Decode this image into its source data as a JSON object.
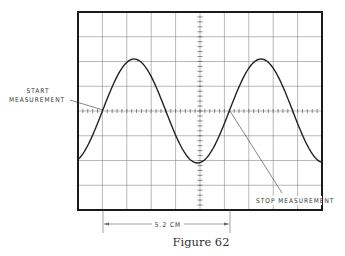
{
  "figure": {
    "caption": "Figure 62",
    "labels": {
      "start_line1": "START",
      "start_line2": "MEASUREMENT",
      "stop": "STOP MEASUREMENT",
      "dimension": "5.2 CM"
    },
    "graticule": {
      "columns": 10,
      "rows": 8,
      "minor_ticks_per_division": 5
    },
    "colors": {
      "frame": "#1a1a1a",
      "grid": "#8a8a8a",
      "trace": "#222222",
      "text": "#333333"
    }
  },
  "chart_data": {
    "type": "line",
    "title": "Figure 62",
    "xlabel": "",
    "ylabel": "",
    "x_divisions": 10,
    "y_divisions": 8,
    "grid": true,
    "series": [
      {
        "name": "sine trace",
        "shape": "sine",
        "amplitude_div": 2.1,
        "period_div": 5.2,
        "phase_start_div": 1.0
      }
    ],
    "annotations": [
      {
        "text": "START MEASUREMENT",
        "x_div": 1.0,
        "y_div": 0
      },
      {
        "text": "STOP MEASUREMENT",
        "x_div": 6.2,
        "y_div": 0
      },
      {
        "text": "5.2 CM",
        "from_div": 1.0,
        "to_div": 6.2
      }
    ]
  }
}
